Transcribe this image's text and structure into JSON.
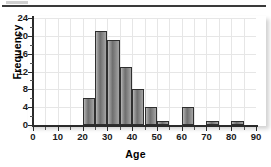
{
  "figure": {
    "top_rule": "page-rule"
  },
  "chart_data": {
    "type": "bar",
    "title": "",
    "xlabel": "Age",
    "ylabel": "Frequency",
    "xlim": [
      0,
      90
    ],
    "ylim": [
      0,
      24
    ],
    "grid": true,
    "legend": null,
    "bin_width": 5,
    "bin_edges": [
      20,
      25,
      30,
      35,
      40,
      45,
      50,
      55,
      60,
      65,
      70,
      75,
      80,
      85
    ],
    "categories": [
      "20-25",
      "25-30",
      "30-35",
      "35-40",
      "40-45",
      "45-50",
      "50-55",
      "55-60",
      "60-65",
      "65-70",
      "70-75",
      "75-80",
      "80-85"
    ],
    "values": [
      6,
      21,
      19,
      13,
      8,
      4,
      1,
      0,
      4,
      0,
      1,
      0,
      1
    ],
    "bars": [
      {
        "start": 20,
        "end": 25,
        "value": 6
      },
      {
        "start": 25,
        "end": 30,
        "value": 21
      },
      {
        "start": 30,
        "end": 35,
        "value": 19
      },
      {
        "start": 35,
        "end": 40,
        "value": 13
      },
      {
        "start": 40,
        "end": 45,
        "value": 8
      },
      {
        "start": 45,
        "end": 50,
        "value": 4
      },
      {
        "start": 50,
        "end": 55,
        "value": 1
      },
      {
        "start": 55,
        "end": 60,
        "value": 0
      },
      {
        "start": 60,
        "end": 65,
        "value": 4
      },
      {
        "start": 65,
        "end": 70,
        "value": 0
      },
      {
        "start": 70,
        "end": 75,
        "value": 1
      },
      {
        "start": 75,
        "end": 80,
        "value": 0
      },
      {
        "start": 80,
        "end": 85,
        "value": 1
      }
    ],
    "y_ticks": [
      0,
      4,
      8,
      12,
      16,
      20,
      24
    ],
    "y_tick_labels": [
      "0",
      "4",
      "8",
      "12",
      "16",
      "20",
      "24"
    ],
    "y_minor_ticks": [
      2,
      6,
      10,
      14,
      18,
      22
    ],
    "x_ticks": [
      0,
      10,
      20,
      30,
      40,
      50,
      60,
      70,
      80,
      90
    ],
    "x_tick_labels": [
      "0",
      "10",
      "20",
      "30",
      "40",
      "50",
      "60",
      "70",
      "80",
      "90"
    ],
    "x_minor_ticks": [
      5,
      15,
      25,
      35,
      45,
      55,
      65,
      75,
      85
    ],
    "colors": {
      "bar_fill": "#8a8a8a",
      "bar_edge": "#2f2f2f",
      "grid": "#e6e6e6",
      "axis": "#2b2b2b",
      "text": "#000000",
      "background": "#ffffff"
    }
  }
}
